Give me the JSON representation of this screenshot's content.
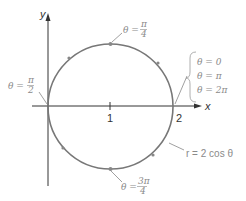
{
  "diagram": {
    "axes": {
      "x_label": "x",
      "y_label": "y",
      "ticks": [
        "1",
        "2"
      ]
    },
    "curve_label": "r = 2 cos θ",
    "point_labels": {
      "top": {
        "theta": "θ =",
        "num": "π",
        "den": "4"
      },
      "left": {
        "theta": "θ =",
        "num": "π",
        "den": "2"
      },
      "bottom": {
        "theta": "θ =",
        "num": "3π",
        "den": "4"
      },
      "right": [
        "θ = 0",
        "θ = π",
        "θ = 2π"
      ]
    },
    "colors": {
      "curve": "#777777",
      "axes": "#333333",
      "labels": "#8a8a8a"
    }
  }
}
